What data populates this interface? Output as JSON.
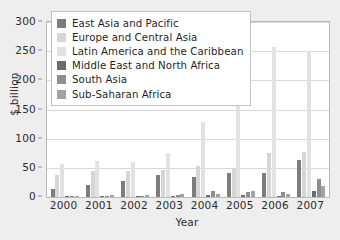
{
  "chart_data": {
    "type": "bar",
    "title": "",
    "xlabel": "Year",
    "ylabel": "$ billion",
    "categories": [
      "2000",
      "2001",
      "2002",
      "2003",
      "2004",
      "2005",
      "2006",
      "2007"
    ],
    "ylim": [
      0,
      300
    ],
    "yticks": [
      0,
      50,
      100,
      150,
      200,
      250,
      300
    ],
    "grid": true,
    "legend_position": "upper-left",
    "series": [
      {
        "name": "East Asia and Pacific",
        "color": "#7d7d7d",
        "values": [
          14,
          20,
          27,
          37,
          34,
          42,
          42,
          64
        ]
      },
      {
        "name": "Europe and Central Asia",
        "color": "#d6d6d6",
        "values": [
          37,
          45,
          45,
          46,
          53,
          49,
          75,
          77
        ]
      },
      {
        "name": "Latin America and the Caribbean",
        "color": "#e2e2e2",
        "values": [
          57,
          61,
          60,
          75,
          128,
          169,
          257,
          250
        ]
      },
      {
        "name": "Middle East and North Africa",
        "color": "#6b6b6b",
        "values": [
          2,
          2,
          2,
          2,
          3,
          4,
          2,
          10
        ]
      },
      {
        "name": "South Asia",
        "color": "#8e8e8e",
        "values": [
          2,
          1,
          2,
          3,
          11,
          9,
          9,
          31
        ]
      },
      {
        "name": "Sub-Saharan Africa",
        "color": "#a3a3a3",
        "values": [
          1,
          3,
          4,
          5,
          6,
          10,
          6,
          19
        ]
      }
    ]
  }
}
